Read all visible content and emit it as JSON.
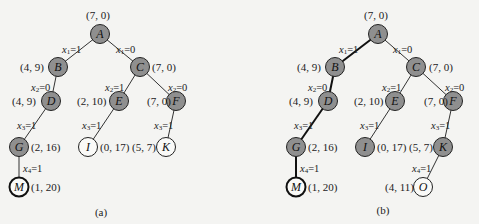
{
  "figure": {
    "panels": [
      {
        "id": "a",
        "caption": "(a)",
        "nodes": [
          {
            "id": "A",
            "label": "A",
            "value": "(7, 0)",
            "style": "filled"
          },
          {
            "id": "B",
            "label": "B",
            "value": "(4, 9)",
            "style": "filled"
          },
          {
            "id": "C",
            "label": "C",
            "value": "(7, 0)",
            "style": "filled"
          },
          {
            "id": "D",
            "label": "D",
            "value": "(4, 9)",
            "style": "filled"
          },
          {
            "id": "E",
            "label": "E",
            "value": "(2, 10)",
            "style": "filled"
          },
          {
            "id": "F",
            "label": "F",
            "value": "(7, 0)",
            "style": "filled"
          },
          {
            "id": "G",
            "label": "G",
            "value": "(2, 16)",
            "style": "filled"
          },
          {
            "id": "I",
            "label": "I",
            "value": "(0, 17)",
            "style": "open"
          },
          {
            "id": "K",
            "label": "K",
            "value": "(5, 7)",
            "style": "open"
          },
          {
            "id": "M",
            "label": "M",
            "value": "(1, 20)",
            "style": "bold"
          }
        ],
        "edges": [
          {
            "from": "A",
            "to": "B",
            "label": "x1=1",
            "var": "x",
            "sub": "1",
            "val": "=1"
          },
          {
            "from": "A",
            "to": "C",
            "label": "x1=0",
            "var": "x",
            "sub": "1",
            "val": "=0"
          },
          {
            "from": "B",
            "to": "D",
            "label": "x2=0",
            "var": "x",
            "sub": "2",
            "val": "=0"
          },
          {
            "from": "C",
            "to": "E",
            "label": "x2=1",
            "var": "x",
            "sub": "2",
            "val": "=1"
          },
          {
            "from": "C",
            "to": "F",
            "label": "x2=0",
            "var": "x",
            "sub": "2",
            "val": "=0"
          },
          {
            "from": "D",
            "to": "G",
            "label": "x3=1",
            "var": "x",
            "sub": "3",
            "val": "=1"
          },
          {
            "from": "E",
            "to": "I",
            "label": "x3=1",
            "var": "x",
            "sub": "3",
            "val": "=1"
          },
          {
            "from": "F",
            "to": "K",
            "label": "x3=1",
            "var": "x",
            "sub": "3",
            "val": "=1"
          },
          {
            "from": "G",
            "to": "M",
            "label": "x4=1",
            "var": "x",
            "sub": "4",
            "val": "=1"
          }
        ]
      },
      {
        "id": "b",
        "caption": "(b)",
        "nodes": [
          {
            "id": "A",
            "label": "A",
            "value": "(7, 0)",
            "style": "filled"
          },
          {
            "id": "B",
            "label": "B",
            "value": "(4, 9)",
            "style": "filled"
          },
          {
            "id": "C",
            "label": "C",
            "value": "(7, 0)",
            "style": "filled"
          },
          {
            "id": "D",
            "label": "D",
            "value": "(4, 9)",
            "style": "filled"
          },
          {
            "id": "E",
            "label": "E",
            "value": "(2, 10)",
            "style": "filled"
          },
          {
            "id": "F",
            "label": "F",
            "value": "(7, 0)",
            "style": "filled"
          },
          {
            "id": "G",
            "label": "G",
            "value": "(2, 16)",
            "style": "filled"
          },
          {
            "id": "I",
            "label": "I",
            "value": "(0, 17)",
            "style": "filled"
          },
          {
            "id": "K",
            "label": "K",
            "value": "(5, 7)",
            "style": "filled"
          },
          {
            "id": "M",
            "label": "M",
            "value": "(1, 20)",
            "style": "bold"
          },
          {
            "id": "O",
            "label": "O",
            "value": "(4, 11)",
            "style": "open"
          }
        ],
        "edges": [
          {
            "from": "A",
            "to": "B",
            "label": "x1=1",
            "var": "x",
            "sub": "1",
            "val": "=1",
            "bold": true
          },
          {
            "from": "A",
            "to": "C",
            "label": "x1=0",
            "var": "x",
            "sub": "1",
            "val": "=0"
          },
          {
            "from": "B",
            "to": "D",
            "label": "x2=0",
            "var": "x",
            "sub": "2",
            "val": "=0",
            "bold": true
          },
          {
            "from": "C",
            "to": "E",
            "label": "x2=1",
            "var": "x",
            "sub": "2",
            "val": "=1"
          },
          {
            "from": "C",
            "to": "F",
            "label": "x2=0",
            "var": "x",
            "sub": "2",
            "val": "=0"
          },
          {
            "from": "D",
            "to": "G",
            "label": "x3=1",
            "var": "x",
            "sub": "3",
            "val": "=1",
            "bold": true
          },
          {
            "from": "E",
            "to": "I",
            "label": "x3=1",
            "var": "x",
            "sub": "3",
            "val": "=1"
          },
          {
            "from": "F",
            "to": "K",
            "label": "x3=1",
            "var": "x",
            "sub": "3",
            "val": "=1"
          },
          {
            "from": "G",
            "to": "M",
            "label": "x4=1",
            "var": "x",
            "sub": "4",
            "val": "=1",
            "bold": true
          },
          {
            "from": "K",
            "to": "O",
            "label": "x4=1",
            "var": "x",
            "sub": "4",
            "val": "=1"
          }
        ]
      }
    ]
  }
}
